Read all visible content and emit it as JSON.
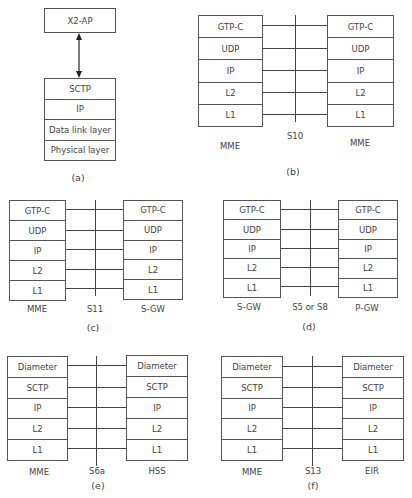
{
  "panels": {
    "a": {
      "caption": "(a)",
      "top_box": "X2-AP",
      "stack": [
        "SCTP",
        "IP",
        "Data link layer",
        "Physical layer"
      ]
    },
    "b": {
      "caption": "(b)",
      "interface": "S10",
      "left_node": "MME",
      "right_node": "MME",
      "left_stack": [
        "GTP-C",
        "UDP",
        "IP",
        "L2",
        "L1"
      ],
      "right_stack": [
        "GTP-C",
        "UDP",
        "IP",
        "L2",
        "L1"
      ]
    },
    "c": {
      "caption": "(c)",
      "interface": "S11",
      "left_node": "MME",
      "right_node": "S-GW",
      "left_stack": [
        "GTP-C",
        "UDP",
        "IP",
        "L2",
        "L1"
      ],
      "right_stack": [
        "GTP-C",
        "UDP",
        "IP",
        "L2",
        "L1"
      ]
    },
    "d": {
      "caption": "(d)",
      "interface": "S5 or S8",
      "left_node": "S-GW",
      "right_node": "P-GW",
      "left_stack": [
        "GTP-C",
        "UDP",
        "IP",
        "L2",
        "L1"
      ],
      "right_stack": [
        "GTP-C",
        "UDP",
        "IP",
        "L2",
        "L1"
      ]
    },
    "e": {
      "caption": "(e)",
      "interface": "S6a",
      "left_node": "MME",
      "right_node": "HSS",
      "left_stack": [
        "Diameter",
        "SCTP",
        "IP",
        "L2",
        "L1"
      ],
      "right_stack": [
        "Diameter",
        "SCTP",
        "IP",
        "L2",
        "L1"
      ]
    },
    "f": {
      "caption": "(f)",
      "interface": "S13",
      "left_node": "MME",
      "right_node": "EIR",
      "left_stack": [
        "Diameter",
        "SCTP",
        "IP",
        "L2",
        "L1"
      ],
      "right_stack": [
        "Diameter",
        "SCTP",
        "IP",
        "L2",
        "L1"
      ]
    }
  },
  "colors": {
    "line": "#444444",
    "text": "#444444",
    "background": "#ffffff"
  }
}
